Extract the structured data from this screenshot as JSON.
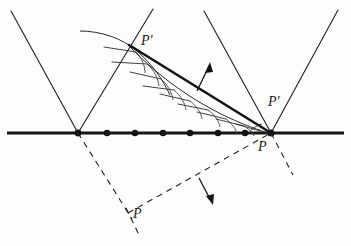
{
  "figure": {
    "background_color": "#fdfdfc",
    "ink_color": "#1a1a1a",
    "width": 351,
    "height": 246,
    "labels": {
      "p_prime_top": "P'",
      "p_prime_right": "P'",
      "p_right": "P",
      "p_bottom": "P"
    },
    "elements": {
      "horizontal_line_name": "spatial-axis",
      "left_cone_name": "left-light-cone",
      "right_cone_name": "right-light-cone",
      "wavefront_name": "hatched-wavefront-curve",
      "chord_name": "thick-chord-line",
      "up_arrow_name": "upward-propagation-arrow",
      "down_arrow_name": "downward-propagation-arrow",
      "dashed_left_name": "dashed-left-reflected-ray",
      "dashed_right_name": "dashed-right-reflected-ray"
    },
    "axis_dots": [
      {
        "x": 78,
        "y": 133
      },
      {
        "x": 107,
        "y": 133
      },
      {
        "x": 135,
        "y": 133
      },
      {
        "x": 163,
        "y": 133
      },
      {
        "x": 190,
        "y": 133
      },
      {
        "x": 218,
        "y": 133
      },
      {
        "x": 245,
        "y": 133
      },
      {
        "x": 271,
        "y": 133
      }
    ],
    "vertices": {
      "left": {
        "x": 78,
        "y": 133
      },
      "right": {
        "x": 271,
        "y": 133
      },
      "bottom": {
        "x": 130,
        "y": 215
      },
      "chord_top": {
        "x": 130,
        "y": 46
      }
    }
  }
}
